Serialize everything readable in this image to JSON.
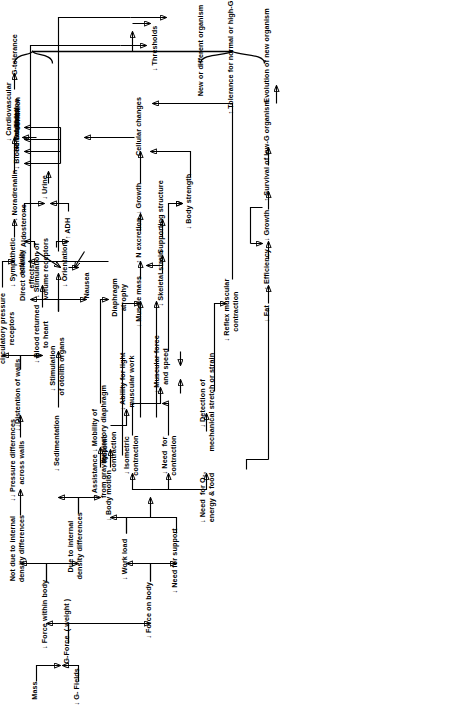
{
  "diagram": {
    "type": "flowchart",
    "orientation": "rotated-90-left",
    "arrow_up": "↑",
    "arrow_down": "↓",
    "nodes": [
      {
        "id": "mass",
        "label": "Mass"
      },
      {
        "id": "g_fields",
        "label": "↓ G- Fields"
      },
      {
        "id": "g_force",
        "label": "↓ G-Force  ( weight )"
      },
      {
        "id": "force_on_body",
        "label": "↓ Force on body"
      },
      {
        "id": "force_within",
        "label": "↓ Force within body"
      },
      {
        "id": "not_due_density",
        "label": "Not due to internal\ndensity differences"
      },
      {
        "id": "due_density",
        "label": "Due to internal\ndensity differences"
      },
      {
        "id": "sedimentation",
        "label": "↓ Sedimentation"
      },
      {
        "id": "assistance",
        "label": "↓ Assistance\nfrom gravity"
      },
      {
        "id": "mobility_diaph",
        "label": "↓ Mobility of\nrespiratory diaphragm"
      },
      {
        "id": "pressure_diff",
        "label": "↓↓ Pressure differences\nacross walls"
      },
      {
        "id": "distention",
        "label": "↓↓Distention of walls"
      },
      {
        "id": "altered_stim",
        "label": "Altered\nStimulation of\ncirculatory pressure\nreceptors"
      },
      {
        "id": "blood_returned",
        "label": "↓ Blood returned\nto heart"
      },
      {
        "id": "stim_volume",
        "label": "↓ Stimulation of\nvolume receptors"
      },
      {
        "id": "adh",
        "label": "↑ ADH"
      },
      {
        "id": "aldosterone",
        "label": "↑ Aldosterone"
      },
      {
        "id": "urine",
        "label": "↓ Urine"
      },
      {
        "id": "blood_volume",
        "label": "↓ Blood volume"
      },
      {
        "id": "hematocrit",
        "label": "↑ Hematocrit"
      },
      {
        "id": "dessication",
        "label": "↑ Dessication"
      },
      {
        "id": "thirst",
        "label": "↑ Thirst"
      },
      {
        "id": "sympathetic",
        "label": "↓ Sympathetic\nactivity"
      },
      {
        "id": "noradrenalin",
        "label": "↓ Noradrenalin"
      },
      {
        "id": "cardio_cond",
        "label": "↓ Cardiovascular\ncondition"
      },
      {
        "id": "g_tolerance",
        "label": "↓ G-tolerance"
      },
      {
        "id": "diaphragm_atr",
        "label": "Diaphragm\natrophy"
      },
      {
        "id": "stim_otolith",
        "label": "↓ Stimulation\nof otolith organs"
      },
      {
        "id": "direct_cellular",
        "label": "Direct cellular\neffects"
      },
      {
        "id": "nausea",
        "label": "Nausea"
      },
      {
        "id": "orientation",
        "label": "↓ Orientation"
      },
      {
        "id": "thresholds",
        "label": "↓ Thresholds"
      },
      {
        "id": "need_support",
        "label": "↓ Need for support"
      },
      {
        "id": "work_load",
        "label": "↓ Work load"
      },
      {
        "id": "body_motion",
        "label": "↓ Body motion"
      },
      {
        "id": "isotonic",
        "label": "↓ Isotonic\ncontraction"
      },
      {
        "id": "ability_light",
        "label": "↓ Ability for light\nmuscular work"
      },
      {
        "id": "isometric",
        "label": "↓ Isometric\ncontraction"
      },
      {
        "id": "need_contract",
        "label": "↓ Need  for\ncontraction"
      },
      {
        "id": "need_o2",
        "label": "↓ Need  for O₂,\nenergy & food"
      },
      {
        "id": "detection",
        "label": "↓ Detection of\nmechanical stretch or strain"
      },
      {
        "id": "muscular_force",
        "label": "↓ Muscular force\nand speed"
      },
      {
        "id": "reflex_musc",
        "label": "↓ Reflex muscular\ncontraction"
      },
      {
        "id": "muscle_mass",
        "label": "↓ Muscle mass"
      },
      {
        "id": "n_excretion",
        "label": "↑ N excretion"
      },
      {
        "id": "growth_top",
        "label": "↓ Growth"
      },
      {
        "id": "skeletal_strain",
        "label": "↓ Skeletal strain"
      },
      {
        "id": "supporting",
        "label": "↓ Supporting structure"
      },
      {
        "id": "body_strength",
        "label": "↓ Body strength"
      },
      {
        "id": "cellular_chg",
        "label": "Cellular changes"
      },
      {
        "id": "fat",
        "label": "↓ Fat"
      },
      {
        "id": "efficiency",
        "label": "↑ Efficiency"
      },
      {
        "id": "growth_bot",
        "label": "↓ Growth"
      },
      {
        "id": "survival",
        "label": "↑ Survival of low-G organism"
      },
      {
        "id": "evolution",
        "label": "Evolution of new organism"
      },
      {
        "id": "new_organism",
        "label": "New or different organism"
      },
      {
        "id": "tolerance_norm",
        "label": "↑ Tolerance for normal or high-G"
      }
    ]
  }
}
